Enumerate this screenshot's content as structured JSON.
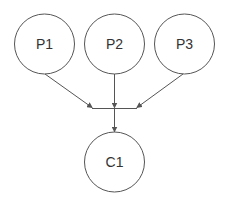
{
  "diagram": {
    "colors": {
      "stroke": "#555555",
      "text": "#333333",
      "background": "#ffffff"
    },
    "nodes": [
      {
        "id": "P1",
        "label": "P1",
        "cx": 44.5,
        "cy": 44,
        "r": 30
      },
      {
        "id": "P2",
        "label": "P2",
        "cx": 114.5,
        "cy": 44,
        "r": 30
      },
      {
        "id": "P3",
        "label": "P3",
        "cx": 184.5,
        "cy": 44,
        "r": 30
      },
      {
        "id": "C1",
        "label": "C1",
        "cx": 114.5,
        "cy": 162,
        "r": 30
      }
    ],
    "junction": {
      "x1": 92,
      "x2": 137,
      "y": 108.5
    },
    "edges": [
      {
        "from": "P1",
        "to": "junction"
      },
      {
        "from": "P2",
        "to": "junction"
      },
      {
        "from": "P3",
        "to": "junction"
      },
      {
        "from": "junction",
        "to": "C1"
      }
    ]
  }
}
